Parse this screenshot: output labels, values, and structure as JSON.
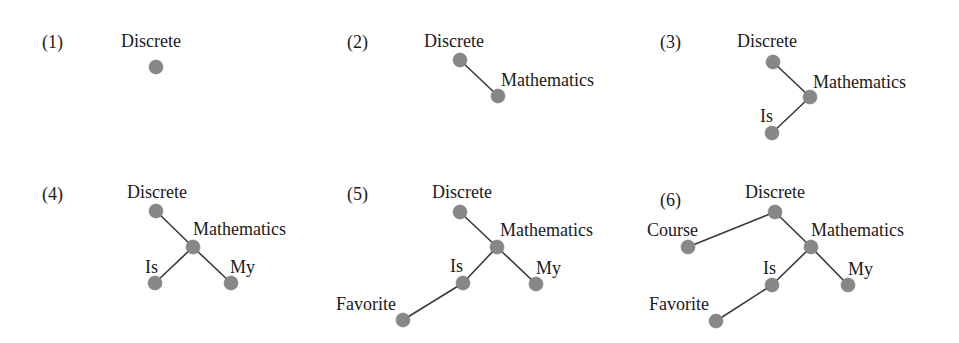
{
  "figure": {
    "node_color": "#878787",
    "edge_color": "#3a3a3a"
  },
  "panels": [
    {
      "number": "(1)",
      "number_pos": [
        42,
        48
      ],
      "nodes": [
        {
          "word": "Discrete",
          "x": 156,
          "y": 67,
          "lx": 121,
          "ly": 47
        }
      ],
      "edges": []
    },
    {
      "number": "(2)",
      "number_pos": [
        347,
        48
      ],
      "nodes": [
        {
          "word": "Discrete",
          "x": 460,
          "y": 60,
          "lx": 424,
          "ly": 47
        },
        {
          "word": "Mathematics",
          "x": 498,
          "y": 96,
          "lx": 501,
          "ly": 86
        }
      ],
      "edges": [
        [
          0,
          1
        ]
      ]
    },
    {
      "number": "(3)",
      "number_pos": [
        660,
        48
      ],
      "nodes": [
        {
          "word": "Discrete",
          "x": 773,
          "y": 62,
          "lx": 737,
          "ly": 47
        },
        {
          "word": "Mathematics",
          "x": 810,
          "y": 97,
          "lx": 813,
          "ly": 88
        },
        {
          "word": "Is",
          "x": 772,
          "y": 133,
          "lx": 760,
          "ly": 122
        }
      ],
      "edges": [
        [
          0,
          1
        ],
        [
          1,
          2
        ]
      ]
    },
    {
      "number": "(4)",
      "number_pos": [
        42,
        200
      ],
      "nodes": [
        {
          "word": "Discrete",
          "x": 156,
          "y": 211,
          "lx": 127,
          "ly": 198
        },
        {
          "word": "Mathematics",
          "x": 193,
          "y": 247,
          "lx": 193,
          "ly": 235
        },
        {
          "word": "Is",
          "x": 155,
          "y": 283,
          "lx": 145,
          "ly": 273
        },
        {
          "word": "My",
          "x": 231,
          "y": 283,
          "lx": 230,
          "ly": 273
        }
      ],
      "edges": [
        [
          0,
          1
        ],
        [
          1,
          2
        ],
        [
          1,
          3
        ]
      ]
    },
    {
      "number": "(5)",
      "number_pos": [
        347,
        200
      ],
      "nodes": [
        {
          "word": "Discrete",
          "x": 460,
          "y": 212,
          "lx": 432,
          "ly": 198
        },
        {
          "word": "Mathematics",
          "x": 497,
          "y": 247,
          "lx": 500,
          "ly": 236
        },
        {
          "word": "Is",
          "x": 463,
          "y": 283,
          "lx": 450,
          "ly": 272
        },
        {
          "word": "My",
          "x": 536,
          "y": 284,
          "lx": 536,
          "ly": 274
        },
        {
          "word": "Favorite",
          "x": 403,
          "y": 320,
          "lx": 336,
          "ly": 310
        }
      ],
      "edges": [
        [
          0,
          1
        ],
        [
          1,
          2
        ],
        [
          1,
          3
        ],
        [
          2,
          4
        ]
      ]
    },
    {
      "number": "(6)",
      "number_pos": [
        660,
        206
      ],
      "nodes": [
        {
          "word": "Discrete",
          "x": 775,
          "y": 212,
          "lx": 745,
          "ly": 198
        },
        {
          "word": "Mathematics",
          "x": 811,
          "y": 247,
          "lx": 811,
          "ly": 236
        },
        {
          "word": "Is",
          "x": 772,
          "y": 285,
          "lx": 763,
          "ly": 274
        },
        {
          "word": "My",
          "x": 848,
          "y": 285,
          "lx": 848,
          "ly": 275
        },
        {
          "word": "Course",
          "x": 688,
          "y": 247,
          "lx": 647,
          "ly": 236
        },
        {
          "word": "Favorite",
          "x": 716,
          "y": 321,
          "lx": 649,
          "ly": 310
        }
      ],
      "edges": [
        [
          0,
          1
        ],
        [
          1,
          2
        ],
        [
          1,
          3
        ],
        [
          0,
          4
        ],
        [
          2,
          5
        ]
      ]
    }
  ]
}
